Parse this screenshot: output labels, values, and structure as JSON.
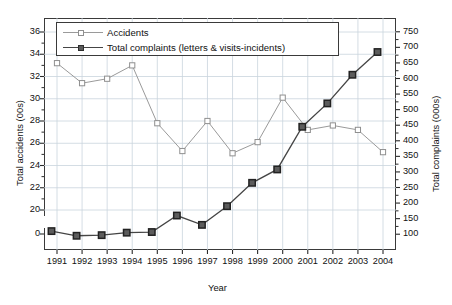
{
  "chart_data": {
    "type": "line",
    "title": "",
    "xlabel": "Year",
    "ylabel": "Total accidents (00s)",
    "y2label": "Total complaints (000s)",
    "grid": true,
    "legend_position": "top-left",
    "categories": [
      "1991",
      "1992",
      "1993",
      "1994",
      "1995",
      "1996",
      "1997",
      "1998",
      "1999",
      "2000",
      "2001",
      "2002",
      "2003",
      "2004"
    ],
    "x": [
      1991,
      1992,
      1993,
      1994,
      1995,
      1996,
      1997,
      1998,
      1999,
      2000,
      2001,
      2002,
      2003,
      2004
    ],
    "ylim": [
      20,
      36
    ],
    "yticks": [
      0,
      20,
      22,
      24,
      26,
      28,
      30,
      32,
      34,
      36
    ],
    "ytick_labels": [
      "0",
      "20",
      "22",
      "24",
      "26",
      "28",
      "30",
      "32",
      "34",
      "36"
    ],
    "y_axis_broken": true,
    "y2lim": [
      75,
      775
    ],
    "y2ticks": [
      100,
      150,
      200,
      250,
      300,
      350,
      400,
      450,
      500,
      550,
      600,
      650,
      700,
      750
    ],
    "y2tick_labels": [
      "100",
      "150",
      "200",
      "250",
      "300",
      "350",
      "400",
      "450",
      "500",
      "550",
      "600",
      "650",
      "700",
      "750"
    ],
    "series": [
      {
        "name": "Accidents",
        "axis": "left",
        "marker": "open-square",
        "color": "#9a9a9a",
        "values": [
          33.2,
          31.4,
          31.8,
          33.0,
          27.8,
          25.3,
          28.0,
          25.1,
          26.1,
          30.1,
          27.2,
          27.6,
          27.2,
          25.2
        ]
      },
      {
        "name": "Total complaints (letters & visits-incidents)",
        "axis": "right",
        "marker": "filled-square",
        "color": "#454545",
        "values": [
          110,
          95,
          97,
          105,
          107,
          160,
          130,
          190,
          265,
          308,
          445,
          520,
          612,
          685
        ]
      }
    ]
  },
  "legend": {
    "items": [
      {
        "label": "Accidents",
        "marker": "open-square-marker",
        "color": "#9a9a9a"
      },
      {
        "label": "Total complaints (letters & visits-incidents)",
        "marker": "filled-square-marker",
        "color": "#454545"
      }
    ]
  },
  "colors": {
    "accidents": "#9a9a9a",
    "complaints": "#454545",
    "grid": "#c9d4dd",
    "frame": "#3a3a3a",
    "background": "#ffffff"
  }
}
